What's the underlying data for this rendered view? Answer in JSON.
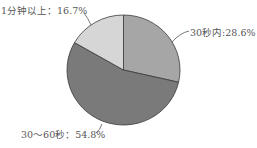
{
  "chart_data": {
    "type": "pie",
    "title": "",
    "categories": [
      "30秒内",
      "30～60秒",
      "1分钟以上"
    ],
    "values": [
      28.6,
      54.8,
      16.7
    ],
    "unit": "%",
    "colors": [
      "#a6a6a6",
      "#7a7a7a",
      "#d6d6d6"
    ],
    "start_angle_deg": 0,
    "direction": "clockwise",
    "labels": [
      "30秒内:28.6%",
      "30～60秒：54.8%",
      "1分钟以上：16.7%"
    ],
    "legend": "none"
  }
}
